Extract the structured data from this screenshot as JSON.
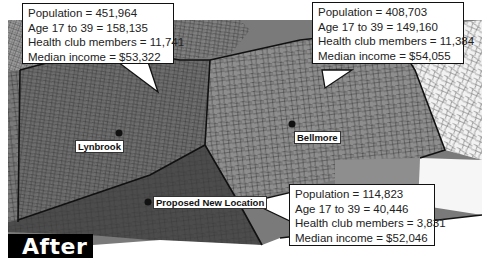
{
  "map": {
    "colors": {
      "lynbrook_region": "#6e6e6e",
      "bellmore_region": "#8c8c8c",
      "proposed_region": "#4a4a4a",
      "outer_light": "#a8a8a8",
      "outer_white": "#f4f4f4",
      "boundary": "#111111",
      "street_lines": "#333333"
    },
    "places": [
      {
        "name": "Lynbrook"
      },
      {
        "name": "Bellmore"
      },
      {
        "name": "Proposed New Location"
      }
    ]
  },
  "callouts": {
    "lynbrook": {
      "population": "Population = 451,964",
      "age": "Age 17 to 39 = 158,135",
      "health_club": "Health club members = 11,741",
      "income": "Median income = $53,322"
    },
    "bellmore": {
      "population": "Population = 408,703",
      "age": "Age 17 to 39 = 149,160",
      "health_club": "Health club members = 11,384",
      "income": "Median income = $54,055"
    },
    "proposed": {
      "population": "Population = 114,823",
      "age": "Age 17 to 39 = 40,446",
      "health_club": "Health club members = 3,831",
      "income": "Median income = $52,046"
    }
  },
  "badge": {
    "label": "After"
  }
}
